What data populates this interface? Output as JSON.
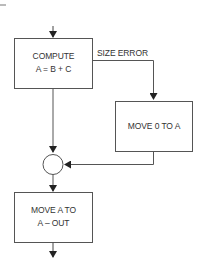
{
  "diagram": {
    "type": "flowchart",
    "colors": {
      "stroke": "#555555",
      "text": "#333333",
      "background": "#ffffff"
    },
    "nodes": [
      {
        "id": "compute",
        "shape": "rectangle",
        "lines": [
          "COMPUTE",
          "A = B + C"
        ]
      },
      {
        "id": "move-zero",
        "shape": "rectangle",
        "lines": [
          "MOVE 0 TO A"
        ]
      },
      {
        "id": "junction",
        "shape": "circle",
        "lines": []
      },
      {
        "id": "move-out",
        "shape": "rectangle",
        "lines": [
          "MOVE A TO",
          "A – OUT"
        ]
      }
    ],
    "edges": [
      {
        "from": "entry",
        "to": "compute",
        "label": ""
      },
      {
        "from": "compute",
        "to": "move-zero",
        "label": "SIZE ERROR"
      },
      {
        "from": "compute",
        "to": "junction",
        "label": ""
      },
      {
        "from": "move-zero",
        "to": "junction",
        "label": ""
      },
      {
        "from": "junction",
        "to": "move-out",
        "label": ""
      },
      {
        "from": "move-out",
        "to": "exit",
        "label": ""
      }
    ]
  }
}
